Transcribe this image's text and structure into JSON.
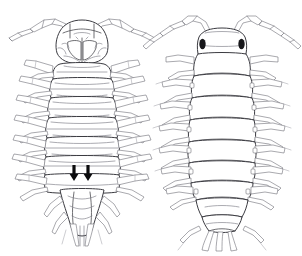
{
  "figure": {
    "kind": "scientific-line-drawing",
    "background_color": "#ffffff",
    "ink_color": "#4a4a4f",
    "ink_strong_color": "#2e2e33",
    "eye_color": "#17171a",
    "arrow_color": "#0b0b0d",
    "width_px": 302,
    "height_px": 256,
    "caption": "",
    "title": ""
  },
  "panels": [
    {
      "id": "ventral",
      "label": "",
      "view": "ventral",
      "position": "left",
      "center_x": 82,
      "body_top": 20,
      "body_bottom": 240,
      "segment_count": 7,
      "pleon_segment_count": 5,
      "has_antennae": true,
      "antenna_count": 2,
      "leg_pairs": 7,
      "has_eyes": false,
      "annotations": [
        {
          "name": "arrow-left",
          "glyph": "down-arrow",
          "x": 74,
          "y": 171,
          "length": 13,
          "color": "#0b0b0d"
        },
        {
          "name": "arrow-right",
          "glyph": "down-arrow",
          "x": 88,
          "y": 171,
          "length": 13,
          "color": "#0b0b0d"
        }
      ]
    },
    {
      "id": "dorsal",
      "label": "",
      "view": "dorsal",
      "position": "right",
      "center_x": 222,
      "body_top": 28,
      "body_bottom": 242,
      "segment_count": 7,
      "pleon_segment_count": 5,
      "has_antennae": true,
      "antenna_count": 2,
      "leg_pairs": 7,
      "has_eyes": true,
      "eyes": [
        {
          "name": "eye-left",
          "x": 203,
          "y": 44
        },
        {
          "name": "eye-right",
          "x": 243,
          "y": 44
        }
      ],
      "annotations": []
    }
  ]
}
